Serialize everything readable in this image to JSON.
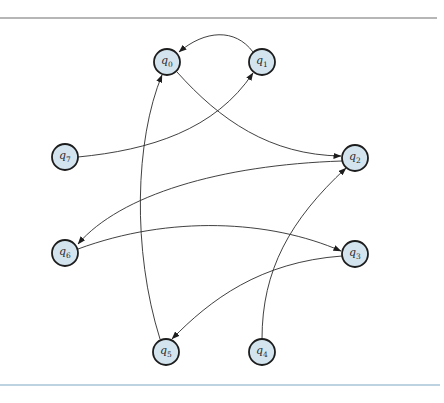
{
  "diagram": {
    "rules": {
      "top": {
        "y": 18,
        "color": "#6e6e6e"
      },
      "bottom": {
        "y": 385,
        "color": "#7fa8c4"
      }
    },
    "node_style": {
      "fill": "#d3e4ee",
      "stroke": "#1d1d1d",
      "radius": 13
    },
    "nodes": [
      {
        "id": "q0",
        "base": "q",
        "sub": "0",
        "x": 167,
        "y": 62
      },
      {
        "id": "q1",
        "base": "q",
        "sub": "1",
        "x": 262,
        "y": 62
      },
      {
        "id": "q2",
        "base": "q",
        "sub": "2",
        "x": 355,
        "y": 158
      },
      {
        "id": "q3",
        "base": "q",
        "sub": "3",
        "x": 355,
        "y": 254
      },
      {
        "id": "q4",
        "base": "q",
        "sub": "4",
        "x": 262,
        "y": 352
      },
      {
        "id": "q5",
        "base": "q",
        "sub": "5",
        "x": 166,
        "y": 352
      },
      {
        "id": "q6",
        "base": "q",
        "sub": "6",
        "x": 65,
        "y": 253
      },
      {
        "id": "q7",
        "base": "q",
        "sub": "7",
        "x": 65,
        "y": 157
      }
    ],
    "edges": [
      {
        "from": "q1",
        "to": "q0"
      },
      {
        "from": "q0",
        "to": "q2"
      },
      {
        "from": "q7",
        "to": "q1"
      },
      {
        "from": "q2",
        "to": "q6"
      },
      {
        "from": "q6",
        "to": "q3"
      },
      {
        "from": "q3",
        "to": "q5"
      },
      {
        "from": "q5",
        "to": "q0"
      },
      {
        "from": "q4",
        "to": "q2"
      }
    ]
  }
}
